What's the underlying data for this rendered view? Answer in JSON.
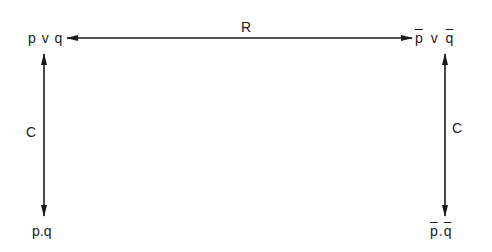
{
  "diagram": {
    "nodes": {
      "top_left": {
        "parts": [
          "p",
          "v",
          "q"
        ],
        "negated": [
          false,
          false,
          false
        ],
        "text": "p v q"
      },
      "top_right": {
        "parts": [
          "p",
          "v",
          "q"
        ],
        "negated": [
          true,
          false,
          true
        ],
        "text": "p̄ v q̄"
      },
      "bottom_left": {
        "parts": [
          "p",
          ".",
          "q"
        ],
        "negated": [
          false,
          false,
          false
        ],
        "text": "p.q"
      },
      "bottom_right": {
        "parts": [
          "p",
          ".",
          "q"
        ],
        "negated": [
          true,
          false,
          true
        ],
        "text": "p̄.q̄"
      }
    },
    "edges": {
      "top": {
        "label": "R",
        "from": "top_left",
        "to": "top_right",
        "bidirectional": true
      },
      "left": {
        "label": "C",
        "from": "top_left",
        "to": "bottom_left",
        "bidirectional": true
      },
      "right": {
        "label": "C",
        "from": "top_right",
        "to": "bottom_right",
        "bidirectional": true
      }
    },
    "colors": {
      "ink": "#1a1a1a",
      "background": "#ffffff"
    }
  }
}
